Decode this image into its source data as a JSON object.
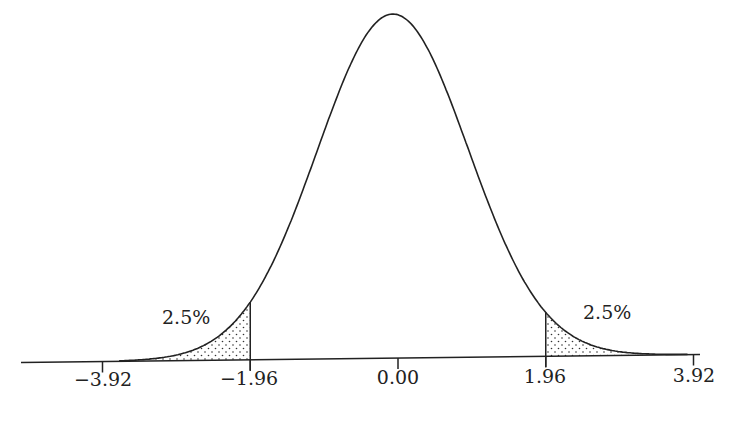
{
  "chart_data": {
    "type": "area",
    "title": "",
    "subtitle": "Standard normal distribution with two-tailed 5% rejection regions",
    "xlabel": "",
    "ylabel": "",
    "xlim": [
      -4.1,
      4.0
    ],
    "grid": false,
    "legend": null,
    "curve": {
      "distribution": "normal",
      "mean": 0.0,
      "sd": 1.0
    },
    "tick_values": [
      -3.92,
      -1.96,
      0.0,
      1.96,
      3.92
    ],
    "tick_labels": [
      "−3.92",
      "−1.96",
      "0.00",
      "1.96",
      "3.92"
    ],
    "shaded_regions": [
      {
        "name": "left-tail",
        "from": -4.0,
        "to": -1.96,
        "area_label": "2.5%",
        "pattern": "dots"
      },
      {
        "name": "right-tail",
        "from": 1.96,
        "to": 4.0,
        "area_label": "2.5%",
        "pattern": "dots"
      }
    ],
    "annotations": [
      "2.5%",
      "2.5%"
    ]
  },
  "labels": {
    "ticks": [
      "−3.92",
      "−1.96",
      "0.00",
      "1.96",
      "3.92"
    ],
    "left_tail": "2.5%",
    "right_tail": "2.5%"
  },
  "colors": {
    "line": "#222222",
    "dots": "#333333",
    "background": "#ffffff"
  }
}
